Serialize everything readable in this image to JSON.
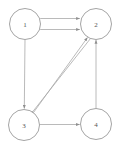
{
  "figure": {
    "background_color": "#ffffff",
    "node_stroke_color": "#9a9a9a",
    "edge_color": "#a8a8a8",
    "label_color": "#555555"
  },
  "graph": {
    "type": "directed-graph",
    "node_radius": 15.5,
    "nodes": [
      {
        "id": "1",
        "label": "1",
        "cx": 25,
        "cy": 24
      },
      {
        "id": "2",
        "label": "2",
        "cx": 96,
        "cy": 24
      },
      {
        "id": "3",
        "label": "3",
        "cx": 24,
        "cy": 125
      },
      {
        "id": "4",
        "label": "4",
        "cx": 96,
        "cy": 124
      }
    ],
    "edges": [
      {
        "from": "1",
        "to": "2",
        "style": "straight",
        "arrow": "end",
        "path": "M 40.2,18.5 L 79.8,18.5"
      },
      {
        "from": "1",
        "to": "2",
        "style": "straight",
        "arrow": "end",
        "path": "M 40.2,29.5 L 79.8,29.5"
      },
      {
        "from": "1",
        "to": "3",
        "style": "straight",
        "arrow": "end",
        "path": "M 25,39.5 L 24.3,108.5"
      },
      {
        "from": "3",
        "to": "2",
        "style": "straight",
        "arrow": "end",
        "path": "M 33.5,112.5 L 87.5,37.5"
      },
      {
        "from": "2",
        "to": "3",
        "style": "straight",
        "arrow": "end",
        "path": "M 90.5,38.5 L 30.5,114.5"
      },
      {
        "from": "3",
        "to": "4",
        "style": "straight",
        "arrow": "end",
        "path": "M 39.5,124.5 L 79.7,124.5"
      },
      {
        "from": "4",
        "to": "2",
        "style": "straight",
        "arrow": "end",
        "path": "M 96,108.5 L 96,40.0"
      }
    ]
  }
}
